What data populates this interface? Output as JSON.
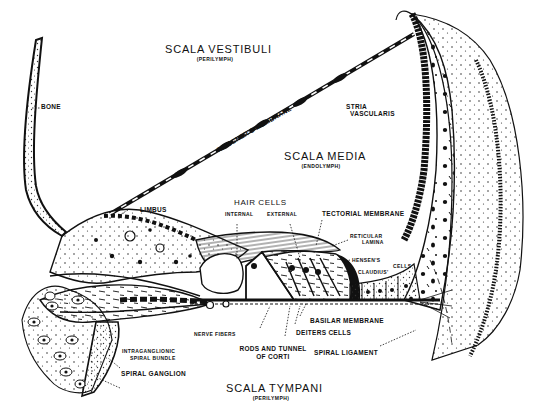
{
  "diagram": {
    "style": "black ink anatomical line drawing on white",
    "colors": {
      "ink": "#111111",
      "background": "#ffffff",
      "stipple": "#333333"
    }
  },
  "regions": {
    "scala_vestibuli": {
      "label": "SCALA VESTIBULI",
      "sublabel": "(PERILYMPH)"
    },
    "scala_media": {
      "label": "SCALA MEDIA",
      "sublabel": "(ENDOLYMPH)"
    },
    "scala_tympani": {
      "label": "SCALA TYMPANI",
      "sublabel": "(PERILYMPH)"
    }
  },
  "labels": {
    "bone": "BONE",
    "reissners_membrane": "REISSNER'S MEMBRANE",
    "stria_vascularis_1": "STRIA",
    "stria_vascularis_2": "VASCULARIS",
    "limbus": "LIMBUS",
    "hair_cells": "HAIR CELLS",
    "internal": "INTERNAL",
    "external": "EXTERNAL",
    "tectorial_membrane": "TECTORIAL MEMBRANE",
    "reticular_lamina_1": "RETICULAR",
    "reticular_lamina_2": "LAMINA",
    "hensens": "HENSEN'S",
    "cells": "CELLS",
    "claudius": "CLAUDIUS'",
    "basilar_membrane": "BASILAR MEMBRANE",
    "deiters_cells": "DEITERS CELLS",
    "nerve_fibers": "NERVE FIBERS",
    "rods_tunnel_1": "RODS AND TUNNEL",
    "rods_tunnel_2": "OF CORTI",
    "spiral_ligament": "SPIRAL LIGAMENT",
    "intraganglionic_1": "INTRAGANGLIONIC",
    "intraganglionic_2": "SPIRAL BUNDLE",
    "spiral_ganglion": "SPIRAL GANGLION"
  }
}
